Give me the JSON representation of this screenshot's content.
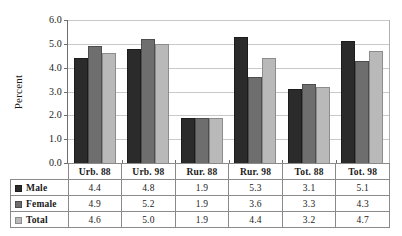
{
  "chart_data": {
    "type": "bar",
    "title": "",
    "xlabel": "",
    "ylabel": "Percent",
    "ylim": [
      0.0,
      6.0
    ],
    "ytick_labels": [
      "6.0",
      "5.0",
      "4.0",
      "3.0",
      "2.0",
      "1.0",
      "0.0"
    ],
    "ytick_values": [
      6.0,
      5.0,
      4.0,
      3.0,
      2.0,
      1.0,
      0.0
    ],
    "grid": true,
    "legend_position": "table-left-column",
    "categories": [
      "Urb. 88",
      "Urb. 98",
      "Rur. 88",
      "Rur. 98",
      "Tot. 88",
      "Tot. 98"
    ],
    "series": [
      {
        "name": "Male",
        "color": "#2b2b2b",
        "values": [
          4.4,
          4.8,
          1.9,
          5.3,
          3.1,
          5.1
        ]
      },
      {
        "name": "Female",
        "color": "#6e6e6e",
        "values": [
          4.9,
          5.2,
          1.9,
          3.6,
          3.3,
          4.3
        ]
      },
      {
        "name": "Total",
        "color": "#b9b9b9",
        "values": [
          4.6,
          5.0,
          1.9,
          4.4,
          3.2,
          4.7
        ]
      }
    ]
  },
  "table": {
    "value_strings": [
      [
        "4.4",
        "4.8",
        "1.9",
        "5.3",
        "3.1",
        "5.1"
      ],
      [
        "4.9",
        "5.2",
        "1.9",
        "3.6",
        "3.3",
        "4.3"
      ],
      [
        "4.6",
        "5.0",
        "1.9",
        "4.4",
        "3.2",
        "4.7"
      ]
    ]
  }
}
